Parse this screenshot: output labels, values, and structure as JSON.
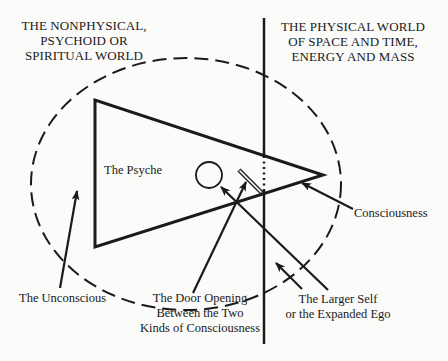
{
  "headings": {
    "left": [
      "THE NONPHYSICAL,",
      "PSYCHOID OR",
      "SPIRITUAL WORLD"
    ],
    "right": [
      "THE PHYSICAL WORLD",
      "OF SPACE AND TIME,",
      "ENERGY AND MASS"
    ]
  },
  "labels": {
    "psyche": "The Psyche",
    "consciousness": "Consciousness",
    "unconscious": "The Unconscious",
    "door": [
      "The Door Opening",
      "Between the Two",
      "Kinds of Consciousness"
    ],
    "larger_self": [
      "The Larger Self",
      "or the Expanded Ego"
    ]
  },
  "colors": {
    "ink": "#1a1a1a",
    "background": "#fbfbfa"
  }
}
